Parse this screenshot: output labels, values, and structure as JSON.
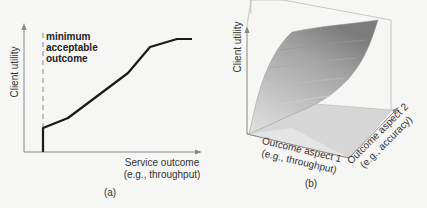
{
  "panel_a": {
    "caption": "(a)",
    "y_axis_label": "Client utility",
    "x_axis_label_line1": "Service outcome",
    "x_axis_label_line2": "(e.g., throughput)",
    "threshold_label_line1": "minimum",
    "threshold_label_line2": "acceptable",
    "threshold_label_line3": "outcome"
  },
  "panel_b": {
    "caption": "(b)",
    "z_axis_label": "Client utility",
    "x_axis_label_line1": "Outcome aspect 1",
    "x_axis_label_line2": "(e.g., throughput)",
    "y_axis_label_line1": "Outcome aspect 2",
    "y_axis_label_line2": "(e.g., accuracy)"
  },
  "colors": {
    "background": "#f6f6f4",
    "axis": "#888888",
    "curve": "#1a1a1a",
    "surface_light": "#dcdcdc",
    "surface_dark": "#8a8a8a"
  }
}
